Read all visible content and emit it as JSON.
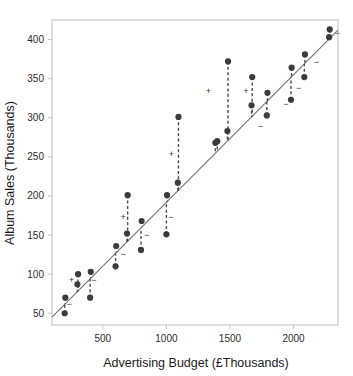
{
  "chart_data": {
    "type": "scatter",
    "title": "",
    "xlabel": "Advertising Budget (£Thousands)",
    "ylabel": "Album Sales (Thousands)",
    "xlim": [
      100,
      2350
    ],
    "ylim": [
      35,
      425
    ],
    "xticks": [
      500,
      1000,
      1500,
      2000
    ],
    "yticks": [
      50,
      100,
      150,
      200,
      250,
      300,
      350,
      400
    ],
    "grid": false,
    "legend": false,
    "point_color": "#3b3b3b",
    "line_color": "#707070",
    "residual_color": "#4a4a4a",
    "frame_color": "#c8c8c8",
    "fit_line": {
      "x": [
        100,
        2350
      ],
      "y": [
        45,
        412
      ],
      "description": "least squares regression line of album sales on advertising budget"
    },
    "points": [
      {
        "x": 200,
        "y": 50,
        "residual_sign": "-"
      },
      {
        "x": 205,
        "y": 70,
        "residual_sign": "+"
      },
      {
        "x": 300,
        "y": 87,
        "residual_sign": "-"
      },
      {
        "x": 305,
        "y": 100,
        "residual_sign": "+"
      },
      {
        "x": 400,
        "y": 70,
        "residual_sign": "-"
      },
      {
        "x": 405,
        "y": 103,
        "residual_sign": "+"
      },
      {
        "x": 600,
        "y": 110,
        "residual_sign": "-"
      },
      {
        "x": 605,
        "y": 136,
        "residual_sign": "+"
      },
      {
        "x": 690,
        "y": 152,
        "residual_sign": "-"
      },
      {
        "x": 695,
        "y": 201,
        "residual_sign": "+"
      },
      {
        "x": 800,
        "y": 131,
        "residual_sign": "-"
      },
      {
        "x": 805,
        "y": 168,
        "residual_sign": "+"
      },
      {
        "x": 1000,
        "y": 151,
        "residual_sign": "-"
      },
      {
        "x": 1005,
        "y": 201,
        "residual_sign": "+"
      },
      {
        "x": 1090,
        "y": 217,
        "residual_sign": "-"
      },
      {
        "x": 1095,
        "y": 301,
        "residual_sign": "+"
      },
      {
        "x": 1385,
        "y": 268,
        "residual_sign": "+"
      },
      {
        "x": 1400,
        "y": 270,
        "residual_sign": "+"
      },
      {
        "x": 1480,
        "y": 283,
        "residual_sign": "-"
      },
      {
        "x": 1485,
        "y": 372,
        "residual_sign": "+"
      },
      {
        "x": 1670,
        "y": 316,
        "residual_sign": "-"
      },
      {
        "x": 1675,
        "y": 352,
        "residual_sign": "+"
      },
      {
        "x": 1790,
        "y": 303,
        "residual_sign": "-"
      },
      {
        "x": 1795,
        "y": 332,
        "residual_sign": "+"
      },
      {
        "x": 1980,
        "y": 323,
        "residual_sign": "-"
      },
      {
        "x": 1985,
        "y": 364,
        "residual_sign": "+"
      },
      {
        "x": 2085,
        "y": 352,
        "residual_sign": "-"
      },
      {
        "x": 2090,
        "y": 381,
        "residual_sign": "+"
      },
      {
        "x": 2280,
        "y": 403,
        "residual_sign": "-"
      },
      {
        "x": 2285,
        "y": 413,
        "residual_sign": "+"
      }
    ],
    "residual_markers": [
      {
        "x": 255,
        "y": 93,
        "sign": "+"
      },
      {
        "x": 235,
        "y": 62,
        "sign": "-"
      },
      {
        "x": 430,
        "y": 93,
        "sign": "-"
      },
      {
        "x": 660,
        "y": 126,
        "sign": "-"
      },
      {
        "x": 660,
        "y": 173,
        "sign": "+"
      },
      {
        "x": 845,
        "y": 150,
        "sign": "-"
      },
      {
        "x": 1035,
        "y": 173,
        "sign": "-"
      },
      {
        "x": 1040,
        "y": 254,
        "sign": "+"
      },
      {
        "x": 1330,
        "y": 334,
        "sign": "+"
      },
      {
        "x": 1625,
        "y": 334,
        "sign": "+"
      },
      {
        "x": 1740,
        "y": 290,
        "sign": "-"
      },
      {
        "x": 1940,
        "y": 318,
        "sign": "-"
      },
      {
        "x": 2040,
        "y": 338,
        "sign": "-"
      },
      {
        "x": 2180,
        "y": 371,
        "sign": "-"
      },
      {
        "x": 2345,
        "y": 409,
        "sign": "-"
      }
    ]
  }
}
